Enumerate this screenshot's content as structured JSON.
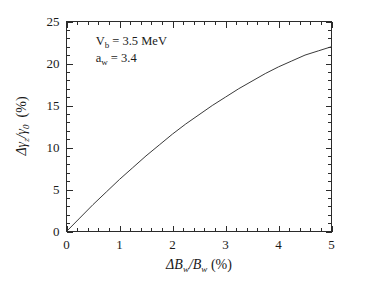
{
  "chart_data": {
    "type": "line",
    "title": "",
    "subtitle": "",
    "xlabel": "ΔB_w/B_w (%)",
    "ylabel": "Δγ_z/γ_0  (%)",
    "xlim": [
      0,
      5
    ],
    "ylim": [
      0,
      25
    ],
    "xticks": [
      0,
      1,
      2,
      3,
      4,
      5
    ],
    "yticks": [
      0,
      5,
      10,
      15,
      20,
      25
    ],
    "xtick_labels": [
      "0",
      "1",
      "2",
      "3",
      "4",
      "5"
    ],
    "ytick_labels": [
      "0",
      "5",
      "10",
      "15",
      "20",
      "25"
    ],
    "x_minor_per_interval": 4,
    "y_minor_per_interval": 4,
    "grid": false,
    "legend": null,
    "series": [
      {
        "name": "delta-gamma-z-over-gamma-0",
        "x": [
          0.0,
          0.25,
          0.5,
          0.75,
          1.0,
          1.25,
          1.5,
          1.75,
          2.0,
          2.25,
          2.5,
          2.75,
          3.0,
          3.25,
          3.5,
          3.75,
          4.0,
          4.25,
          4.5,
          4.75,
          5.0
        ],
        "values": [
          0.0,
          1.6,
          3.2,
          4.7,
          6.2,
          7.6,
          9.0,
          10.3,
          11.6,
          12.8,
          13.9,
          15.0,
          16.0,
          17.0,
          17.9,
          18.8,
          19.6,
          20.3,
          21.0,
          21.5,
          22.0
        ]
      }
    ],
    "annotations": [
      {
        "name": "barrier-voltage",
        "base": "V",
        "subscript": "b",
        "rest": " = 3.5 MeV",
        "x": 0.55,
        "y": 22.2
      },
      {
        "name": "wiggler-parameter",
        "base": "a",
        "subscript": "w",
        "rest": " = 3.4",
        "x": 0.55,
        "y": 20.2
      }
    ],
    "axis_label_parts": {
      "y_delta": "Δ",
      "y_gamma": "γ",
      "y_sub_z": "z",
      "y_slash": "/",
      "y_gamma2": "γ",
      "y_sub_0": "0",
      "y_unit": "(%)",
      "x_delta": "Δ",
      "x_B": "B",
      "x_sub_w1": "w",
      "x_slash": "/",
      "x_B2": "B",
      "x_sub_w2": "w",
      "x_unit": "(%)"
    },
    "colors": {
      "curve": "#3a3a3a",
      "axis": "#2b2b2b",
      "text": "#1a1a1a",
      "background": "#ffffff"
    }
  }
}
